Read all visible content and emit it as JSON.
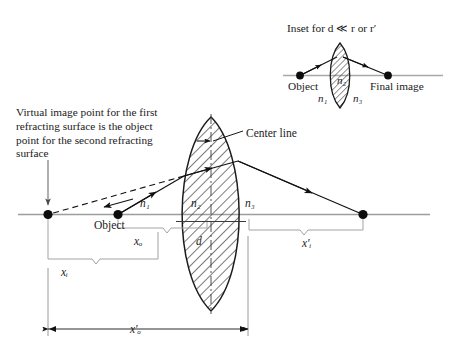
{
  "figure": {
    "type": "optics-ray-diagram",
    "title_inset": "Inset for  d ≪ r  or  r′",
    "caption": "Virtual image point for the first refracting surface is the object point for the second refracting surface",
    "center_line_label": "Center line"
  },
  "main": {
    "object_label": "Object",
    "indices": {
      "n1": "n₁",
      "n2": "n₂",
      "n3": "n₃"
    },
    "dimensions": {
      "xo": "xₒ",
      "d": "d",
      "xi": "xᵢ",
      "xi_prime": "x′ᵢ",
      "xo_prime": "x′ₒ"
    },
    "points": {
      "virtual_image_point": "virtual-image-point",
      "object_point": "object-point",
      "final_image_point": "final-image-point"
    }
  },
  "inset": {
    "object_label": "Object",
    "final_image_label": "Final image",
    "indices": {
      "n1": "n₁",
      "n2": "n₂",
      "n3": "n₃"
    }
  },
  "colors": {
    "ink": "#1b1b1b",
    "axis": "#8f8f8f",
    "hatch": "#2b2b2b",
    "dimension": "#9a9a9a"
  }
}
